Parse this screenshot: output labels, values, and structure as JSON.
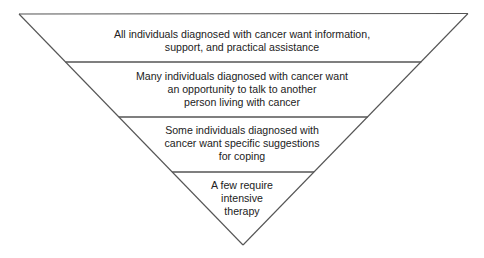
{
  "diagram": {
    "type": "inverted-pyramid",
    "colors": {
      "outline": "#555555",
      "text": "#222222",
      "background": "#ffffff"
    },
    "tiers": [
      {
        "level": 1,
        "lines": [
          "All individuals diagnosed with cancer want information,",
          "support, and practical assistance"
        ]
      },
      {
        "level": 2,
        "lines": [
          "Many individuals diagnosed with cancer want",
          "an opportunity to talk to another",
          "person living with cancer"
        ]
      },
      {
        "level": 3,
        "lines": [
          "Some individuals diagnosed with",
          "cancer want specific suggestions",
          "for coping"
        ]
      },
      {
        "level": 4,
        "lines": [
          "A few require",
          "intensive",
          "therapy"
        ]
      }
    ]
  }
}
